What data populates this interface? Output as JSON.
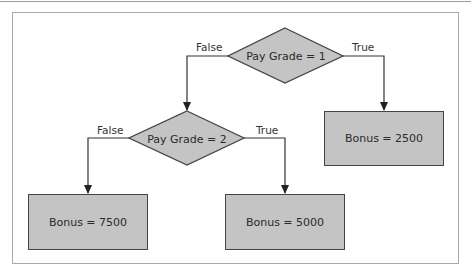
{
  "diagram": {
    "type": "decision-flowchart",
    "decisions": [
      {
        "id": "d1",
        "label": "Pay Grade = 1",
        "false_label": "False",
        "true_label": "True"
      },
      {
        "id": "d2",
        "label": "Pay Grade = 2",
        "false_label": "False",
        "true_label": "True"
      }
    ],
    "outcomes": [
      {
        "id": "o1",
        "label": "Bonus = 2500"
      },
      {
        "id": "o2",
        "label": "Bonus = 7500"
      },
      {
        "id": "o3",
        "label": "Bonus = 5000"
      }
    ],
    "edges": [
      {
        "from": "d1",
        "to": "d2",
        "label": "False"
      },
      {
        "from": "d1",
        "to": "o1",
        "label": "True"
      },
      {
        "from": "d2",
        "to": "o2",
        "label": "False"
      },
      {
        "from": "d2",
        "to": "o3",
        "label": "True"
      }
    ],
    "colors": {
      "shape_fill": "#c4c4c4",
      "stroke": "#444444",
      "frame": "#a8a8a8"
    }
  }
}
